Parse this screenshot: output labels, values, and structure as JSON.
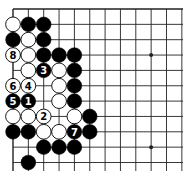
{
  "board": {
    "origin_x": 13,
    "origin_y": 9,
    "spacing": 15.35,
    "cols": 12,
    "rows": 11,
    "right_extent": 183,
    "bottom_extent": 171,
    "line_color": "#222222",
    "black_color": "#000000",
    "white_color": "#ffffff",
    "star_points": [
      [
        9,
        3
      ],
      [
        9,
        9
      ]
    ]
  },
  "stones": [
    {
      "col": 0,
      "row": 1,
      "color": "white"
    },
    {
      "col": 1,
      "row": 1,
      "color": "black"
    },
    {
      "col": 2,
      "row": 1,
      "color": "black"
    },
    {
      "col": 0,
      "row": 2,
      "color": "black"
    },
    {
      "col": 1,
      "row": 2,
      "color": "white"
    },
    {
      "col": 2,
      "row": 2,
      "color": "black"
    },
    {
      "col": 0,
      "row": 3,
      "color": "white",
      "label": "8"
    },
    {
      "col": 1,
      "row": 3,
      "color": "white"
    },
    {
      "col": 2,
      "row": 3,
      "color": "black"
    },
    {
      "col": 3,
      "row": 3,
      "color": "black"
    },
    {
      "col": 4,
      "row": 3,
      "color": "black"
    },
    {
      "col": 1,
      "row": 4,
      "color": "white"
    },
    {
      "col": 2,
      "row": 4,
      "color": "black",
      "label": "3"
    },
    {
      "col": 3,
      "row": 4,
      "color": "white"
    },
    {
      "col": 4,
      "row": 4,
      "color": "black"
    },
    {
      "col": 0,
      "row": 5,
      "color": "white",
      "label": "6"
    },
    {
      "col": 1,
      "row": 5,
      "color": "white",
      "label": "4"
    },
    {
      "col": 3,
      "row": 5,
      "color": "white"
    },
    {
      "col": 4,
      "row": 5,
      "color": "black"
    },
    {
      "col": 0,
      "row": 6,
      "color": "black",
      "label": "5"
    },
    {
      "col": 1,
      "row": 6,
      "color": "black",
      "label": "1"
    },
    {
      "col": 3,
      "row": 6,
      "color": "white"
    },
    {
      "col": 4,
      "row": 6,
      "color": "black"
    },
    {
      "col": 0,
      "row": 7,
      "color": "white"
    },
    {
      "col": 1,
      "row": 7,
      "color": "white"
    },
    {
      "col": 2,
      "row": 7,
      "color": "white",
      "label": "2"
    },
    {
      "col": 4,
      "row": 7,
      "color": "white"
    },
    {
      "col": 5,
      "row": 7,
      "color": "black"
    },
    {
      "col": 0,
      "row": 8,
      "color": "black"
    },
    {
      "col": 1,
      "row": 8,
      "color": "black"
    },
    {
      "col": 2,
      "row": 8,
      "color": "white"
    },
    {
      "col": 3,
      "row": 8,
      "color": "white"
    },
    {
      "col": 4,
      "row": 8,
      "color": "black",
      "label": "7"
    },
    {
      "col": 5,
      "row": 8,
      "color": "black"
    },
    {
      "col": 2,
      "row": 9,
      "color": "black"
    },
    {
      "col": 3,
      "row": 9,
      "color": "black"
    },
    {
      "col": 4,
      "row": 9,
      "color": "black"
    },
    {
      "col": 1,
      "row": 10,
      "color": "black"
    }
  ]
}
